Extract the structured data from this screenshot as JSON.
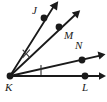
{
  "figure": {
    "kind": "geometry-ray-diagram",
    "background_color": "#ffffff",
    "stroke_color": "#1a1a1a",
    "vertex": {
      "name": "K",
      "x": 10,
      "y": 76,
      "label_x": 5,
      "label_y": 82
    },
    "points": [
      {
        "name": "J",
        "x": 44,
        "y": 18,
        "label_x": 32,
        "label_y": 7
      },
      {
        "name": "M",
        "x": 59,
        "y": 27,
        "label_x": 63,
        "label_y": 30
      },
      {
        "name": "N",
        "x": 82,
        "y": 60,
        "label_x": 74,
        "label_y": 41
      },
      {
        "name": "L",
        "x": 85,
        "y": 76,
        "label_x": 82,
        "label_y": 83
      }
    ],
    "rays": [
      {
        "name": "ray-KJ",
        "through": "J",
        "tip_x": 57,
        "tip_y": 2
      },
      {
        "name": "ray-KM",
        "through": "M",
        "tip_x": 79,
        "tip_y": 11
      },
      {
        "name": "ray-KN",
        "through": "N",
        "tip_x": 105,
        "tip_y": 54
      },
      {
        "name": "ray-KL",
        "through": "L",
        "tip_x": 105,
        "tip_y": 76
      }
    ],
    "tick_marks": [
      {
        "name": "angle-tick-JKM",
        "x": 26,
        "y": 53,
        "angle_deg": -42
      },
      {
        "name": "angle-tick-NKL",
        "x": 41,
        "y": 70,
        "angle_deg": -8
      }
    ]
  }
}
